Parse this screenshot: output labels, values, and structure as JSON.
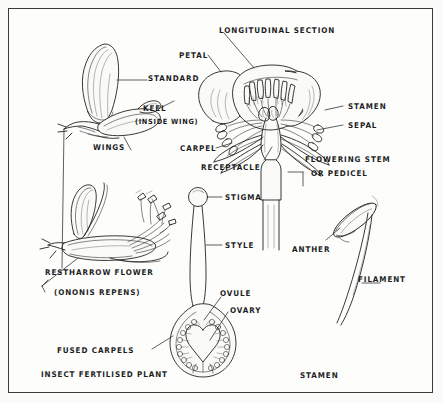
{
  "page": {
    "background_color": "#fbfbfa",
    "frame_color": "#3a3a3a",
    "ink_color": "#222222",
    "title_note": "Hand-drawn botanical diagram of flower parts"
  },
  "figures": {
    "restharrow_top": {
      "name": "Restharrow flower petals, intact",
      "labels": {
        "standard": "STANDARD",
        "keel": "KEEL",
        "keel_note": "(INSIDE WING)",
        "wings": "WINGS"
      }
    },
    "restharrow_dissected": {
      "name": "Restharrow flower, dissected showing stamens",
      "caption_line1": "RESTHARROW FLOWER",
      "caption_line2": "(ONONIS REPENS)",
      "caption_line3": "INSECT FERTILISED PLANT"
    },
    "longitudinal_section": {
      "name": "Longitudinal section of a buttercup-type flower",
      "title": "LONGITUDINAL SECTION",
      "labels": {
        "petal": "PETAL",
        "stamen": "STAMEN",
        "sepal": "SEPAL",
        "carpel": "CARPEL",
        "receptacle": "RECEPTACLE",
        "stem_line1": "FLOWERING STEM",
        "stem_line2": "OR PEDICEL"
      }
    },
    "carpel_section": {
      "name": "Carpel longitudinal section",
      "labels": {
        "stigma": "STIGMA",
        "style": "STYLE",
        "ovule": "OVULE",
        "ovary": "OVARY",
        "fused_carpels": "FUSED CARPELS"
      },
      "ovule_count": 18
    },
    "stamen_detail": {
      "name": "Single stamen detail",
      "labels": {
        "anther": "ANTHER",
        "filament": "FILAMENT",
        "caption": "STAMEN"
      }
    }
  }
}
